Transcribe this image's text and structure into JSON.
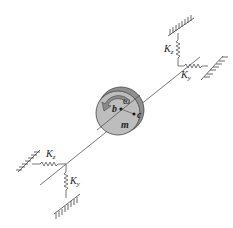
{
  "diagram": {
    "type": "rotor-on-flexible-supports",
    "labels": {
      "top_kz": "K",
      "top_kz_sub": "z",
      "top_ky": "K",
      "top_ky_sub": "y",
      "bottom_kz": "K",
      "bottom_kz_sub": "z",
      "bottom_ky": "K",
      "bottom_ky_sub": "y",
      "omega": "ω",
      "b": "b",
      "c": "c",
      "m": "m"
    },
    "colors": {
      "disk_face": "#bdbdbd",
      "disk_rim": "#8f8f8f",
      "arrow": "#8a8a8a",
      "line": "#555555"
    }
  }
}
